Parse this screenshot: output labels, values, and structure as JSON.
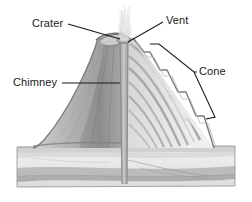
{
  "figure": {
    "background_color": "#ffffff",
    "line_color": "#1a1a1a",
    "width": 252,
    "height": 202
  },
  "labels": {
    "crater": "Crater",
    "vent": "Vent",
    "cone": "Cone",
    "chimney": "Chimney"
  },
  "diagram": {
    "view": "cutaway cross-section",
    "colors": {
      "cutaway_face_dark": "#8d8d8d",
      "cutaway_face_mid": "#a5a5a5",
      "slope_light": "#e0e0e0",
      "slope_mid": "#c9c9c9",
      "strata_band": "#9a9a9a",
      "ground_light": "#ededed",
      "ground_band": "#b0b0b0",
      "bedrock_band": "#9c9c9c",
      "conduit": "#b8b8b8",
      "smoke": "#e8e8e8"
    },
    "parts": [
      {
        "name": "crater",
        "description": "bowl depression at the summit"
      },
      {
        "name": "vent",
        "description": "opening at top of the chimney where material escapes"
      },
      {
        "name": "cone",
        "description": "layered outer slope built of lava and ash"
      },
      {
        "name": "chimney",
        "description": "vertical conduit through the centre of the volcano"
      },
      {
        "name": "smoke-plume",
        "description": "steam and ash rising from the vent"
      },
      {
        "name": "ground-strata",
        "description": "horizontal sedimentary rock layers beneath the volcano"
      }
    ]
  },
  "leaders": {
    "crater": "diagonal line from label down-right to crater rim",
    "vent": "diagonal line from label down-left to the vent opening",
    "cone": "bracket spanning the outer slope with apex at the label",
    "chimney": "horizontal line from label right to the central conduit"
  }
}
